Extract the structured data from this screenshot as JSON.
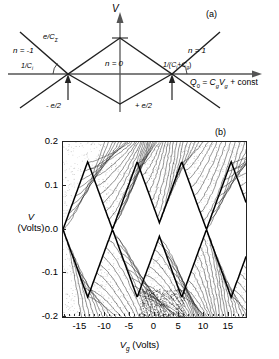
{
  "figure": {
    "panel_a_tag": "(a)",
    "panel_b_tag": "(b)"
  },
  "panel_a": {
    "type": "schematic",
    "description": "Coulomb blockade stability diagram: sawtooth diamond boundaries of Coulomb gap voltage V versus background charge Q0",
    "vertical_axis_label": "V",
    "horizontal_axis_label": "Q",
    "horizontal_axis_label_sub": "0",
    "horizontal_axis_expression": " = C",
    "horizontal_axis_expression_sub1": "g",
    "horizontal_axis_expression_mid": "V",
    "horizontal_axis_expression_sub2": "g",
    "horizontal_axis_expression_end": " + const",
    "peak_label": "e/C",
    "peak_label_sub": "Σ",
    "region_left": "n = -1",
    "region_center": "n = 0",
    "region_right": "n = 1",
    "slope_left": "1/C",
    "slope_left_sub": "i",
    "slope_right": "1/(C",
    "slope_right_sub1": "i",
    "slope_right_mid": "+C",
    "slope_right_sub2": "g",
    "slope_right_end": ")",
    "marker_left": "- e/2",
    "marker_right": "+ e/2"
  },
  "chart_data": {
    "type": "line",
    "title": "",
    "subtitle": "",
    "xlabel": "Vg (Volts)",
    "ylabel": "V (Volts)",
    "xlim": [
      -18.5,
      18.5
    ],
    "ylim": [
      -0.2,
      0.2
    ],
    "xticks": [
      -15,
      -10,
      -5,
      0,
      5,
      10,
      15
    ],
    "xticklabels": [
      "-15",
      "-10",
      "-5",
      "0",
      "5",
      "10",
      "15"
    ],
    "yticks": [
      0.2,
      0.1,
      0.0,
      -0.1,
      -0.2
    ],
    "yticklabels": [
      "0.2",
      "0.1",
      "0.0",
      "-0.1",
      "-0.2"
    ],
    "grid": false,
    "legend": false,
    "series_count": 61,
    "series_note": "Stacked current-voltage traces; each trace offset vertically, envelopes trace out Coulomb blockade diamonds",
    "diamond_apices_vg": [
      -13.5,
      -3.5,
      5.5,
      15.5
    ],
    "diamond_half_width_vg": 5.0,
    "diamond_gap_volts": 0.155,
    "upper_envelope_label": "Coulomb gap upper edge",
    "lower_envelope_label": "Coulomb gap lower edge"
  }
}
